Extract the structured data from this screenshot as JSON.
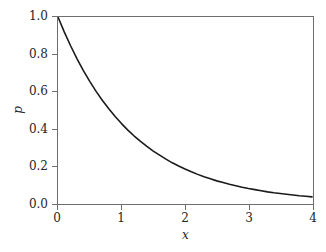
{
  "chart_data": {
    "type": "line",
    "title": "",
    "subtitle": "",
    "xlabel": "x",
    "ylabel": "p",
    "xlim": [
      0,
      4
    ],
    "ylim": [
      0.0,
      1.0
    ],
    "grid": false,
    "legend": false,
    "xticks": [
      "0",
      "1",
      "2",
      "3",
      "4"
    ],
    "xtick_values": [
      0,
      1,
      2,
      3,
      4
    ],
    "yticks": [
      "0.0",
      "0.2",
      "0.4",
      "0.6",
      "0.8",
      "1.0"
    ],
    "ytick_values": [
      0.0,
      0.2,
      0.4,
      0.6,
      0.8,
      1.0
    ],
    "series": [
      {
        "name": "p",
        "color": "#1a1a1a",
        "x": [
          0.0,
          0.1,
          0.2,
          0.3,
          0.4,
          0.5,
          0.6,
          0.7,
          0.8,
          0.9,
          1.0,
          1.1,
          1.2,
          1.3,
          1.4,
          1.5,
          1.6,
          1.7,
          1.8,
          1.9,
          2.0,
          2.1,
          2.2,
          2.3,
          2.4,
          2.5,
          2.6,
          2.7,
          2.8,
          2.9,
          3.0,
          3.1,
          3.2,
          3.3,
          3.4,
          3.5,
          3.6,
          3.7,
          3.8,
          3.9,
          4.0
        ],
        "values": [
          1.0,
          0.919,
          0.844,
          0.775,
          0.712,
          0.654,
          0.6,
          0.551,
          0.507,
          0.465,
          0.427,
          0.392,
          0.36,
          0.331,
          0.304,
          0.279,
          0.257,
          0.236,
          0.216,
          0.199,
          0.183,
          0.168,
          0.154,
          0.141,
          0.13,
          0.119,
          0.11,
          0.101,
          0.093,
          0.085,
          0.078,
          0.072,
          0.066,
          0.06,
          0.055,
          0.051,
          0.047,
          0.043,
          0.039,
          0.036,
          0.033
        ]
      }
    ]
  },
  "axes": {
    "frame_color": "#6e6e6e",
    "background": "#ffffff"
  }
}
